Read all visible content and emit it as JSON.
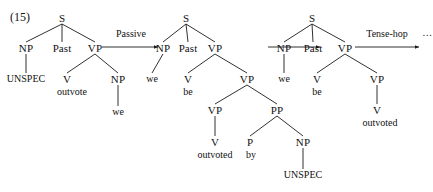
{
  "figure": {
    "example_number": "(15)",
    "stroke_color": "#1a1a1a",
    "text_color": "#111111",
    "background_color": "#ffffff"
  },
  "arrows": [
    {
      "label": "Passive",
      "label_x": 131,
      "label_y": 34,
      "x1": 102,
      "y1": 47,
      "x2": 158,
      "y2": 47
    },
    {
      "label": "",
      "label_x": 0,
      "label_y": 0,
      "x1": 268,
      "y1": 47,
      "x2": 320,
      "y2": 47
    },
    {
      "label": "Tense-hop",
      "label_x": 387,
      "label_y": 34,
      "x1": 355,
      "y1": 47,
      "x2": 419,
      "y2": 47
    }
  ],
  "ellipsis": {
    "text": "…",
    "x": 428,
    "y": 33
  },
  "trees": [
    {
      "name": "tree-initial",
      "nodes": [
        {
          "id": "t1-s",
          "label": "S",
          "x": 62,
          "y": 18,
          "kind": "node"
        },
        {
          "id": "t1-np",
          "label": "NP",
          "x": 26,
          "y": 48,
          "kind": "node"
        },
        {
          "id": "t1-past",
          "label": "Past",
          "x": 62,
          "y": 48,
          "kind": "node"
        },
        {
          "id": "t1-vp",
          "label": "VP",
          "x": 95,
          "y": 48,
          "kind": "node"
        },
        {
          "id": "t1-unspec",
          "label": "UNSPEC",
          "x": 26,
          "y": 79,
          "kind": "leaf"
        },
        {
          "id": "t1-v",
          "label": "V",
          "x": 67,
          "y": 79,
          "kind": "node"
        },
        {
          "id": "t1-outvote",
          "label": "outvote",
          "x": 72,
          "y": 92,
          "kind": "leaf"
        },
        {
          "id": "t1-np2",
          "label": "NP",
          "x": 118,
          "y": 79,
          "kind": "node"
        },
        {
          "id": "t1-we",
          "label": "we",
          "x": 118,
          "y": 112,
          "kind": "leaf"
        }
      ],
      "edges": [
        [
          "t1-s",
          "t1-np"
        ],
        [
          "t1-s",
          "t1-past"
        ],
        [
          "t1-s",
          "t1-vp"
        ],
        [
          "t1-np",
          "t1-unspec"
        ],
        [
          "t1-vp",
          "t1-v"
        ],
        [
          "t1-vp",
          "t1-np2"
        ],
        [
          "t1-np2",
          "t1-we"
        ]
      ]
    },
    {
      "name": "tree-passive",
      "nodes": [
        {
          "id": "t2-s",
          "label": "S",
          "x": 186,
          "y": 18,
          "kind": "node"
        },
        {
          "id": "t2-np",
          "label": "NP",
          "x": 163,
          "y": 48,
          "kind": "node"
        },
        {
          "id": "t2-past",
          "label": "Past",
          "x": 188,
          "y": 48,
          "kind": "node"
        },
        {
          "id": "t2-vp",
          "label": "VP",
          "x": 215,
          "y": 48,
          "kind": "node"
        },
        {
          "id": "t2-we",
          "label": "we",
          "x": 152,
          "y": 79,
          "kind": "leaf"
        },
        {
          "id": "t2-v",
          "label": "V",
          "x": 188,
          "y": 79,
          "kind": "node"
        },
        {
          "id": "t2-be",
          "label": "be",
          "x": 188,
          "y": 92,
          "kind": "leaf"
        },
        {
          "id": "t2-vp2",
          "label": "VP",
          "x": 247,
          "y": 79,
          "kind": "node"
        },
        {
          "id": "t2-vp3",
          "label": "VP",
          "x": 215,
          "y": 110,
          "kind": "node"
        },
        {
          "id": "t2-pp",
          "label": "PP",
          "x": 277,
          "y": 110,
          "kind": "node"
        },
        {
          "id": "t2-v2",
          "label": "V",
          "x": 215,
          "y": 142,
          "kind": "node"
        },
        {
          "id": "t2-outvoted",
          "label": "outvoted",
          "x": 215,
          "y": 155,
          "kind": "leaf"
        },
        {
          "id": "t2-p",
          "label": "P",
          "x": 250,
          "y": 142,
          "kind": "node"
        },
        {
          "id": "t2-by",
          "label": "by",
          "x": 251,
          "y": 155,
          "kind": "leaf"
        },
        {
          "id": "t2-np2",
          "label": "NP",
          "x": 303,
          "y": 142,
          "kind": "node"
        },
        {
          "id": "t2-unspec",
          "label": "UNSPEC",
          "x": 303,
          "y": 175,
          "kind": "leaf"
        }
      ],
      "edges": [
        [
          "t2-s",
          "t2-np"
        ],
        [
          "t2-s",
          "t2-past"
        ],
        [
          "t2-s",
          "t2-vp"
        ],
        [
          "t2-np",
          "t2-we"
        ],
        [
          "t2-vp",
          "t2-v"
        ],
        [
          "t2-vp",
          "t2-vp2"
        ],
        [
          "t2-vp2",
          "t2-vp3"
        ],
        [
          "t2-vp2",
          "t2-pp"
        ],
        [
          "t2-vp3",
          "t2-v2"
        ],
        [
          "t2-pp",
          "t2-p"
        ],
        [
          "t2-pp",
          "t2-np2"
        ],
        [
          "t2-np2",
          "t2-unspec"
        ]
      ]
    },
    {
      "name": "tree-tense-hop-input",
      "nodes": [
        {
          "id": "t3-s",
          "label": "S",
          "x": 312,
          "y": 18,
          "kind": "node"
        },
        {
          "id": "t3-np",
          "label": "NP",
          "x": 284,
          "y": 48,
          "kind": "node"
        },
        {
          "id": "t3-past",
          "label": "Past",
          "x": 313,
          "y": 48,
          "kind": "node"
        },
        {
          "id": "t3-vp",
          "label": "VP",
          "x": 345,
          "y": 48,
          "kind": "node"
        },
        {
          "id": "t3-we",
          "label": "we",
          "x": 284,
          "y": 79,
          "kind": "leaf"
        },
        {
          "id": "t3-v",
          "label": "V",
          "x": 317,
          "y": 79,
          "kind": "node"
        },
        {
          "id": "t3-be",
          "label": "be",
          "x": 317,
          "y": 92,
          "kind": "leaf"
        },
        {
          "id": "t3-vp2",
          "label": "VP",
          "x": 377,
          "y": 79,
          "kind": "node"
        },
        {
          "id": "t3-v2",
          "label": "V",
          "x": 377,
          "y": 110,
          "kind": "node"
        },
        {
          "id": "t3-outvoted",
          "label": "outvoted",
          "x": 380,
          "y": 123,
          "kind": "leaf"
        }
      ],
      "edges": [
        [
          "t3-s",
          "t3-np"
        ],
        [
          "t3-s",
          "t3-past"
        ],
        [
          "t3-s",
          "t3-vp"
        ],
        [
          "t3-np",
          "t3-we"
        ],
        [
          "t3-vp",
          "t3-v"
        ],
        [
          "t3-vp",
          "t3-vp2"
        ],
        [
          "t3-vp2",
          "t3-v2"
        ]
      ]
    }
  ]
}
